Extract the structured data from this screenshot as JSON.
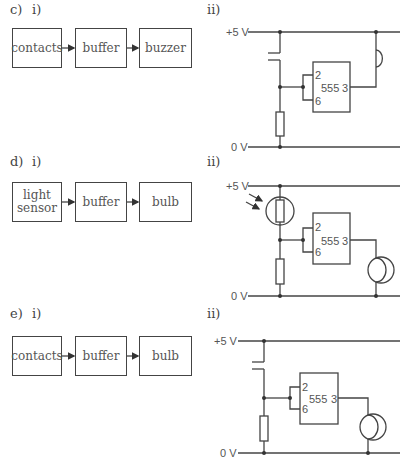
{
  "sections": [
    {
      "part": "c)",
      "block_label": "i)",
      "circuit_label": "ii)",
      "blocks": [
        "contacts",
        "buffer",
        "buzzer"
      ],
      "circuit": {
        "supply": "+5 V",
        "ground": "0 V",
        "chip": "555",
        "pin_trigger": "2",
        "pin_threshold": "6",
        "pin_output": "3",
        "input": "contacts",
        "output": "buzzer"
      }
    },
    {
      "part": "d)",
      "block_label": "i)",
      "circuit_label": "ii)",
      "blocks": [
        "light\nsensor",
        "buffer",
        "bulb"
      ],
      "circuit": {
        "supply": "+5 V",
        "ground": "0 V",
        "chip": "555",
        "pin_trigger": "2",
        "pin_threshold": "6",
        "pin_output": "3",
        "input": "LDR",
        "output": "bulb"
      }
    },
    {
      "part": "e)",
      "block_label": "i)",
      "circuit_label": "ii)",
      "blocks": [
        "contacts",
        "buffer",
        "bulb"
      ],
      "circuit": {
        "supply": "+5 V",
        "ground": "0 V",
        "chip": "555",
        "pin_trigger": "2",
        "pin_threshold": "6",
        "pin_output": "3",
        "input": "contacts",
        "output": "bulb"
      }
    }
  ]
}
